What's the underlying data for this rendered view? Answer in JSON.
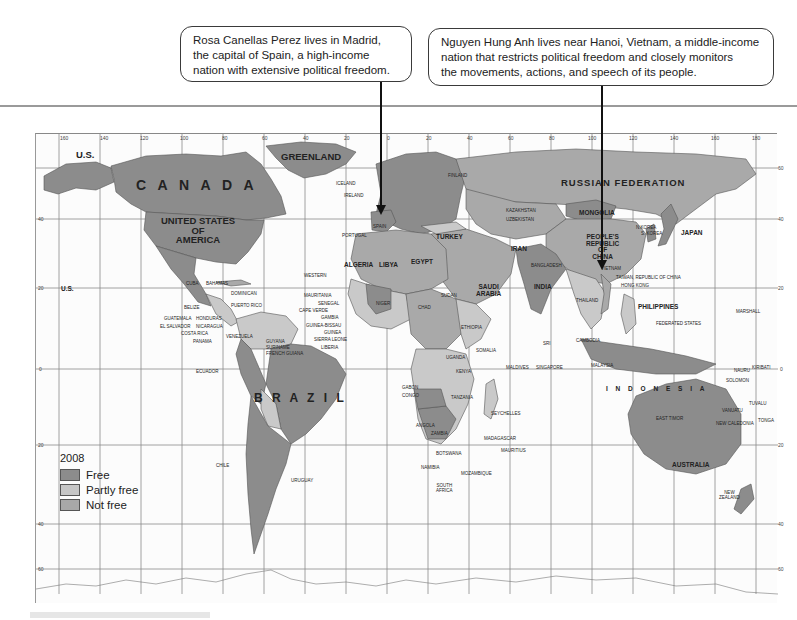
{
  "callouts": {
    "madrid": {
      "lines": [
        "Rosa Canellas Perez lives in Madrid,",
        "the capital of Spain, a high-income",
        "nation with extensive political freedom."
      ],
      "points_to": "Spain"
    },
    "hanoi": {
      "lines": [
        "Nguyen Hung Anh lives near Hanoi, Vietnam, a middle-income",
        "nation that restricts political freedom and closely monitors",
        "the movements, actions, and speech of its people."
      ],
      "points_to": "Vietnam"
    }
  },
  "legend": {
    "title": "2008",
    "items": [
      {
        "label": "Free",
        "color": "#8c8c8c"
      },
      {
        "label": "Partly free",
        "color": "#c6c6c6"
      },
      {
        "label": "Not free",
        "color": "#a8a8a8"
      }
    ]
  },
  "colors": {
    "free": "#8c8c8c",
    "partly_free": "#c9c9c9",
    "not_free": "#a9a9a9",
    "ocean": "#fcfcfc",
    "grid": "#8a8a8a"
  },
  "axes": {
    "longitude_top": [
      "160",
      "140",
      "120",
      "100",
      "80",
      "60",
      "40",
      "20",
      "0",
      "20",
      "40",
      "60",
      "80",
      "100",
      "120",
      "140",
      "160",
      "180"
    ],
    "latitude_right": [
      "60",
      "40",
      "20",
      "0",
      "20",
      "40",
      "60"
    ],
    "latitude_left": [
      "40",
      "20",
      "0",
      "20",
      "40",
      "60"
    ]
  },
  "labels": {
    "continents_major": {
      "canada": "C A N A D A",
      "usa": [
        "UNITED STATES",
        "OF",
        "AMERICA"
      ],
      "us_alaska": "U.S.",
      "us_hawaii": "U.S.",
      "greenland": "GREENLAND",
      "russia": "RUSSIAN   FEDERATION",
      "brazil": "B R A Z I L",
      "australia": "AUSTRALIA",
      "indonesia": "I N D O N E S I A",
      "china": [
        "PEOPLE'S",
        "REPUBLIC",
        "OF",
        "CHINA"
      ]
    },
    "countries": {
      "iceland": "ICELAND",
      "ireland": "IRELAND",
      "portugal": "PORTUGAL",
      "spain": "SPAIN",
      "norway": "NORWAY",
      "finland": "FINLAND",
      "estonia": "ESTONIA",
      "latvia": "LATVIA",
      "lithuania": "LITHUANIA",
      "kazakhstan": "KAZAKHSTAN",
      "uzbekistan": "UZBEKISTAN",
      "kyrgyzstan": "KYRGYZSTAN",
      "tajikistan": "TAJIKISTAN",
      "turkmenistan": "TURKMENISTAN",
      "mongolia": "MONGOLIA",
      "n_korea": "N.KOREA",
      "s_korea": "S. KOREA",
      "japan": "JAPAN",
      "turkey": "TURKEY",
      "ukraine": "UKRAINE",
      "georgia": "GEORGIA",
      "armenia": "ARMENIA",
      "tunisia": "TUNISIA",
      "morocco": "MOROCCO",
      "algeria": "ALGERIA",
      "libya": "LIBYA",
      "egypt": "EGYPT",
      "israel": "ISRAEL",
      "lebanon": "LEBANON",
      "syria": "SYRIA",
      "iraq": "IRAQ",
      "iran": "IRAN",
      "kuwait": "KUWAIT",
      "bahrain": "BAHRAIN",
      "qatar": "QATAR",
      "uae": "U.A.E.",
      "oman": "OMAN",
      "yemen": "YEMEN",
      "saudi_arabia": [
        "SAUDI",
        "ARABIA"
      ],
      "pakistan": "PAKISTAN",
      "india": "INDIA",
      "nepal": "NEPAL",
      "bhutan": "BHUTAN",
      "bangladesh": "BANGLADESH",
      "laos": "LAOS",
      "vietnam": "VIETNAM",
      "taiwan": "TAIWAN, REPUBLIC OF CHINA",
      "hong_kong": "HONG KONG",
      "macao": "MACAO",
      "thailand": "THAILAND",
      "cambodia": "CAMBODIA",
      "philippines": "PHILIPPINES",
      "sri_lanka": [
        "SRI",
        "LANKA"
      ],
      "maldives": "MALDIVES",
      "singapore": "SINGAPORE",
      "malaysia": "MALAYSIA",
      "brunei": "BRUNEI",
      "palau": "PALAU",
      "micronesia": [
        "FEDERATED STATES",
        "OF MICRONESIA"
      ],
      "marshall": [
        "MARSHALL",
        "ISLANDS"
      ],
      "nauru": "NAURU",
      "kiribati": "KIRIBATI",
      "png": [
        "PAPUA",
        "NEW GUINEA"
      ],
      "solomon": [
        "SOLOMON",
        "ISLANDS"
      ],
      "tuvalu": "TUVALU",
      "vanuatu": "VANUATU",
      "w_samoa": [
        "WESTERN",
        "SAMOA"
      ],
      "fiji": "FIJI",
      "tonga": "TONGA",
      "new_caledonia": "NEW CALEDONIA",
      "new_zealand": [
        "NEW",
        "ZEALAND"
      ],
      "east_timor": "EAST TIMOR",
      "mexico": "MEXICO",
      "cuba": "CUBA",
      "bahamas": "BAHAMAS",
      "dominican": [
        "DOMINICAN",
        "REPUBLIC"
      ],
      "puerto_rico": "PUERTO RICO",
      "jamaica": "JAMAICA",
      "haiti": "HAITI",
      "belize": "BELIZE",
      "guatemala": "GUATEMALA",
      "honduras": "HONDURAS",
      "el_salvador": "EL SALVADOR",
      "nicaragua": "NICARAGUA",
      "costa_rica": "COSTA RICA",
      "panama": "PANAMA",
      "venezuela": "VENEZUELA",
      "colombia": "COLOMBIA",
      "guyana": "GUYANA",
      "suriname": "SURINAME",
      "french_guiana": "FRENCH GUIANA",
      "ecuador": "ECUADOR",
      "peru": "PERU",
      "bolivia": "BOLIVIA",
      "paraguay": "PARAGUAY",
      "chile": "CHILE",
      "argentina": "ARGENTINA",
      "uruguay": "URUGUAY",
      "st_kitts": "ST KITTS & NEVIS",
      "antigua": "ANTIGUA & BARBUDA",
      "dominica": "DOMINICA",
      "st_lucia": "ST LUCIA",
      "st_vincent": "ST VINCENT",
      "barbados": "BARBADOS",
      "grenada": "GRENADA",
      "trinidad": "TRINIDAD & TOBAGO",
      "w_sahara": [
        "WESTERN",
        "SAHARA"
      ],
      "mauritania": "MAURITANIA",
      "senegal": "SENEGAL",
      "cape_verde": "CAPE VERDE",
      "gambia": "GAMBIA",
      "guinea_bissau": "GUINEA-BISSAU",
      "guinea": "GUINEA",
      "sierra_leone": "SIERRA LEONE",
      "liberia": "LIBERIA",
      "ivory_coast": [
        "IVORY",
        "COAST"
      ],
      "mali": "M A L I",
      "burkina": [
        "BURKINA",
        "FASO"
      ],
      "ghana": "GHANA",
      "togo": "TOGO",
      "benin": "BENIN",
      "niger": "NIGER",
      "nigeria": "NIGERIA",
      "chad": "CHAD",
      "sudan": "SUDAN",
      "eritrea": "ERITREA",
      "djibouti": "DJIBOUTI",
      "ethiopia": "ETHIOPIA",
      "somalia": "SOMALIA",
      "car": [
        "CENT.",
        "AFR.",
        "REP."
      ],
      "cameroon": "CAMEROON",
      "eq_guinea": [
        "EQUATORIAL",
        "GUINEA"
      ],
      "sao_tome": [
        "SÃO TOMÉ",
        "& PRINCIPE"
      ],
      "gabon": "GABON",
      "congo": "CONGO",
      "drc": [
        "DEM.",
        "REP.",
        "OF THE",
        "CONGO"
      ],
      "uganda": "UGANDA",
      "kenya": "KENYA",
      "rwanda": "RWANDA",
      "burundi": "BURUNDI",
      "tanzania": "TANZANIA",
      "seychelles": "SEYCHELLES",
      "comoros": "COMOROS",
      "malawi": "MALAWI",
      "angola": "ANGOLA",
      "zambia": "ZAMBIA",
      "zimbabwe": "ZIMBABWE",
      "botswana": "BOTSWANA",
      "namibia": "NAMIBIA",
      "mozambique": "MOZAMBIQUE",
      "madagascar": "MADAGASCAR",
      "mauritius": "MAURITIUS",
      "swaziland": "SWAZILAND",
      "lesotho": "LESOTHO",
      "south_africa": [
        "SOUTH",
        "AFRICA"
      ]
    }
  }
}
